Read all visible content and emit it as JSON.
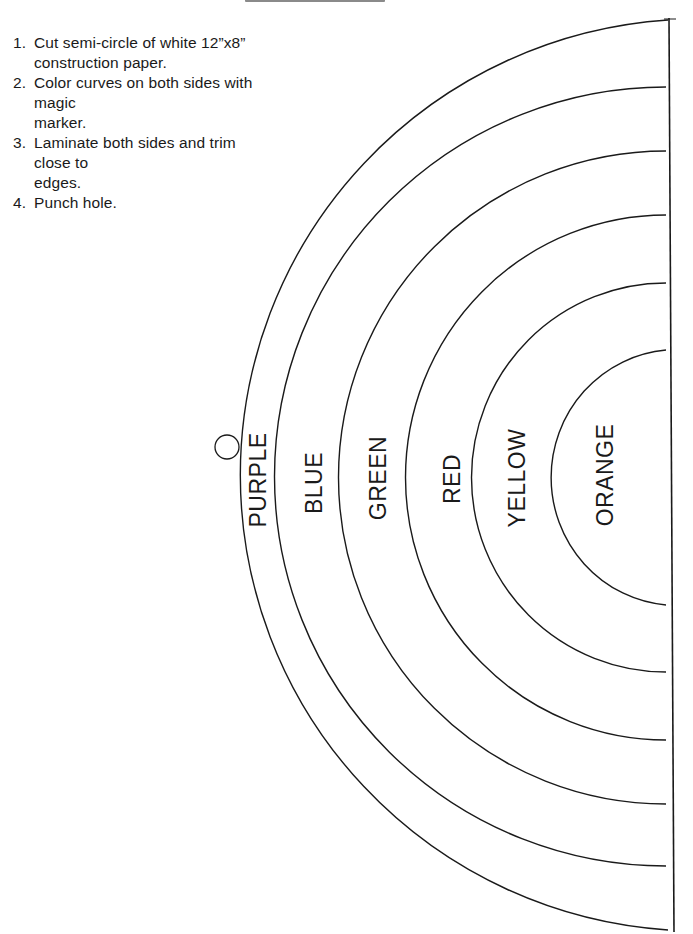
{
  "instructions": [
    {
      "num": "1.",
      "line1": "Cut semi-circle of white 12”x8”",
      "line2": "construction paper."
    },
    {
      "num": "2.",
      "line1": "Color curves on both sides with magic",
      "line2": "marker."
    },
    {
      "num": "3.",
      "line1": "Laminate both sides and trim close to",
      "line2": "edges."
    },
    {
      "num": "4.",
      "line1": "Punch hole.",
      "line2": ""
    }
  ],
  "bands": [
    {
      "label": "PURPLE",
      "color": "#000000"
    },
    {
      "label": "BLUE",
      "color": "#000000"
    },
    {
      "label": "GREEN",
      "color": "#000000"
    },
    {
      "label": "RED",
      "color": "#000000"
    },
    {
      "label": "YELLOW",
      "color": "#000000"
    },
    {
      "label": "ORANGE",
      "color": "#000000"
    }
  ],
  "punch_hole": "punch-hole-circle"
}
